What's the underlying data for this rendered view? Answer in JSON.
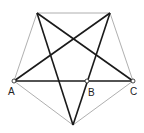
{
  "labels": {
    "A": "A",
    "B": "B",
    "C": "C"
  },
  "colors": {
    "star": "#1a1a1a",
    "pentagon": "#9a9a9a"
  }
}
